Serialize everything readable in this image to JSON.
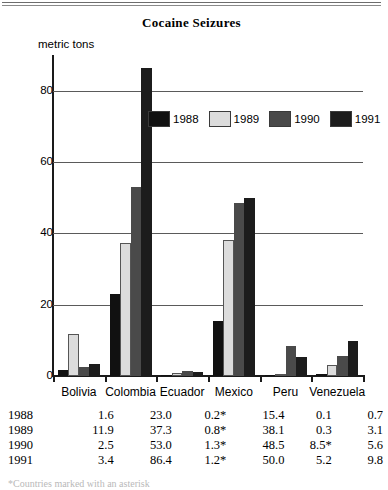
{
  "chart_data": {
    "type": "bar",
    "title": "Cocaine Seizures",
    "xlabel": "",
    "ylabel": "metric tons",
    "ylim": [
      0,
      90
    ],
    "yticks": [
      0,
      20,
      40,
      60,
      80
    ],
    "grid": true,
    "legend_position": "inside-top-center",
    "categories": [
      "Bolivia",
      "Colombia",
      "Ecuador",
      "Mexico",
      "Peru",
      "Venezuela"
    ],
    "series": [
      {
        "name": "1988",
        "color": "#111111",
        "values": [
          1.6,
          23.0,
          0.2,
          15.4,
          0.1,
          0.7
        ]
      },
      {
        "name": "1989",
        "color": "#dcdcdc",
        "values": [
          11.9,
          37.3,
          0.8,
          38.1,
          0.3,
          3.1
        ]
      },
      {
        "name": "1990",
        "color": "#4a4a4a",
        "values": [
          2.5,
          53.0,
          1.3,
          48.5,
          8.5,
          5.6
        ]
      },
      {
        "name": "1991",
        "color": "#1c1c1c",
        "values": [
          3.4,
          86.4,
          1.2,
          50.0,
          5.2,
          9.8
        ]
      }
    ]
  },
  "table": {
    "row_header_label": "",
    "columns": [
      "Bolivia",
      "Colombia",
      "Ecuador",
      "Mexico",
      "Peru",
      "Venezuela"
    ],
    "rows": [
      {
        "year": "1988",
        "values": [
          "1.6",
          "23.0",
          "0.2*",
          "15.4",
          "0.1",
          "0.7"
        ]
      },
      {
        "year": "1989",
        "values": [
          "11.9",
          "37.3",
          "0.8*",
          "38.1",
          "0.3",
          "3.1"
        ]
      },
      {
        "year": "1990",
        "values": [
          "2.5",
          "53.0",
          "1.3*",
          "48.5",
          "8.5*",
          "5.6"
        ]
      },
      {
        "year": "1991",
        "values": [
          "3.4",
          "86.4",
          "1.2*",
          "50.0",
          "5.2",
          "9.8"
        ]
      }
    ]
  },
  "footnote": "*Countries marked with an asterisk"
}
